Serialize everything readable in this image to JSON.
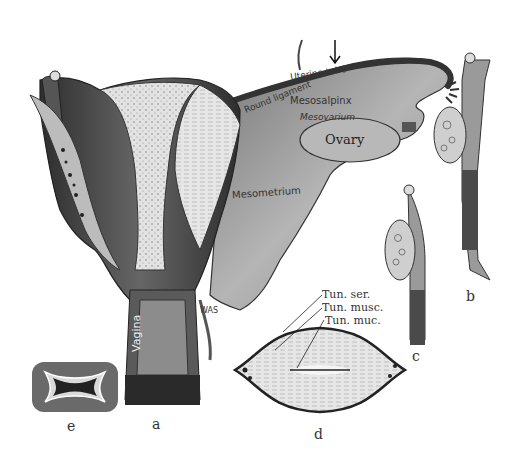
{
  "figure": {
    "panels": [
      "a",
      "b",
      "c",
      "d",
      "e"
    ],
    "panel_labels": {
      "a": "a",
      "b": "b",
      "c": "c",
      "d": "d",
      "e": "e"
    },
    "structure_labels": {
      "round_ligament": "Round ligament",
      "uterine_tube": "Uterine tube",
      "mesosalpinx": "Mesosalpinx",
      "mesovarium": "Mesovarium",
      "ovary": "Ovary",
      "mesometrium": "Mesometrium",
      "vagina": "Vagina",
      "was": "WAS"
    },
    "section_d_labels": {
      "serosa": "Tun. ser.",
      "muscularis": "Tun. musc.",
      "mucosa": "Tun. muc."
    },
    "colors": {
      "ink": "#222222",
      "tissue_light": "#dcdcdc",
      "tissue_mid": "#9a9a9a",
      "tissue_dark": "#3a3a3a",
      "background": "#ffffff"
    }
  }
}
